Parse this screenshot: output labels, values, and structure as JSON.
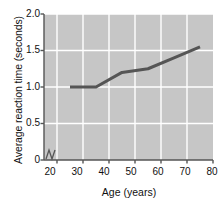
{
  "chart_data": {
    "type": "line",
    "title": "",
    "xlabel": "Age (years)",
    "ylabel": "Average reaction time (seconds)",
    "xlim": [
      15,
      80
    ],
    "ylim": [
      0,
      2.0
    ],
    "xticks": [
      20,
      30,
      40,
      50,
      60,
      70,
      80
    ],
    "xtick_labels": [
      "20",
      "30",
      "40",
      "50",
      "60",
      "70",
      "80"
    ],
    "yticks": [
      0,
      0.5,
      1.0,
      1.5,
      2.0
    ],
    "ytick_labels": [
      "0",
      "0.5",
      "1.0",
      "1.5",
      "2.0"
    ],
    "grid": true,
    "grid_color": "#ffffff",
    "plot_background": "#c6c6c6",
    "legend": null,
    "axis_break": "y-axis broken near origin",
    "series": [
      {
        "name": "Average reaction time",
        "color": "#555555",
        "line_width": 3,
        "x": [
          25,
          35,
          45,
          55,
          65,
          75
        ],
        "y": [
          1.0,
          1.0,
          1.2,
          1.25,
          1.4,
          1.55
        ]
      }
    ]
  },
  "axis": {
    "ylabel": "Average reaction time (seconds)",
    "xlabel": "Age (years)",
    "ytick_labels": [
      "2.0",
      "1.5",
      "1.0",
      "0.5",
      "0"
    ],
    "xtick_labels": [
      "20",
      "30",
      "40",
      "50",
      "60",
      "70",
      "80"
    ]
  },
  "colors": {
    "line": "#555555",
    "plot_bg": "#c6c6c6",
    "grid": "#ffffff",
    "axis": "#555555",
    "text": "#111111"
  }
}
